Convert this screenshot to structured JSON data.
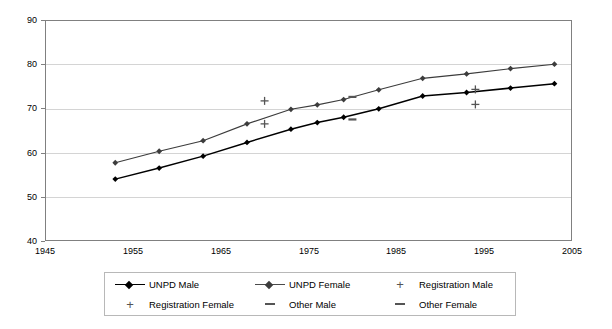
{
  "chart_data": {
    "type": "line",
    "title": "",
    "subtitle": "",
    "xlabel": "",
    "ylabel": "",
    "xlim": [
      1945,
      2005
    ],
    "ylim": [
      40,
      90
    ],
    "xticks": [
      1945,
      1955,
      1965,
      1975,
      1985,
      1995,
      2005
    ],
    "yticks": [
      40,
      50,
      60,
      70,
      80,
      90
    ],
    "grid": "horizontal",
    "legend_position": "bottom",
    "series": [
      {
        "name": "UNPD Male",
        "style": "line-with-diamond-markers",
        "color": "#000000",
        "x": [
          1953,
          1958,
          1963,
          1968,
          1973,
          1976,
          1979,
          1983,
          1988,
          1993,
          1998,
          2003
        ],
        "values": [
          54.0,
          56.5,
          59.2,
          62.3,
          65.3,
          66.8,
          68.0,
          69.9,
          72.8,
          73.6,
          74.6,
          75.6
        ]
      },
      {
        "name": "UNPD Female",
        "style": "line-with-diamond-markers",
        "color": "#3c3c3c",
        "x": [
          1953,
          1958,
          1963,
          1968,
          1973,
          1976,
          1979,
          1983,
          1988,
          1993,
          1998,
          2003
        ],
        "values": [
          57.7,
          60.3,
          62.7,
          66.5,
          69.8,
          70.8,
          72.0,
          74.2,
          76.8,
          77.8,
          79.0,
          80.0
        ]
      },
      {
        "name": "Registration Male",
        "style": "plus-markers-only",
        "color": "#555555",
        "x": [
          1970,
          1994
        ],
        "values": [
          66.5,
          70.9
        ]
      },
      {
        "name": "Registration Female",
        "style": "plus-markers-only",
        "color": "#555555",
        "x": [
          1970,
          1994
        ],
        "values": [
          71.7,
          74.3
        ]
      },
      {
        "name": "Other Male",
        "style": "dash-markers-only",
        "color": "#555555",
        "x": [
          1980
        ],
        "values": [
          67.5
        ]
      },
      {
        "name": "Other Female",
        "style": "dash-markers-only",
        "color": "#555555",
        "x": [
          1980
        ],
        "values": [
          72.6
        ]
      }
    ]
  },
  "axis": {
    "y_labels": [
      "90",
      "80",
      "70",
      "60",
      "50",
      "40"
    ],
    "x_labels": [
      "1945",
      "1955",
      "1965",
      "1975",
      "1985",
      "1995",
      "2005"
    ]
  },
  "legend": {
    "items": [
      {
        "label": "UNPD Male",
        "key": "line-diamond-black"
      },
      {
        "label": "UNPD Female",
        "key": "line-diamond-grey"
      },
      {
        "label": "Registration Male",
        "key": "plus-marker"
      },
      {
        "label": "Registration Female",
        "key": "plus-marker"
      },
      {
        "label": "Other Male",
        "key": "dash-marker"
      },
      {
        "label": "Other Female",
        "key": "dash-marker"
      }
    ]
  }
}
